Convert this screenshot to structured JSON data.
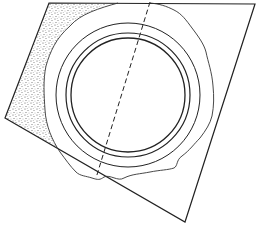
{
  "diagram": {
    "type": "line-art technical illustration",
    "stroke_color": "#222222",
    "stipple_color": "#555555",
    "background": "#ffffff",
    "plate": {
      "points": [
        [
          49,
          3
        ],
        [
          255,
          4
        ],
        [
          185,
          222
        ],
        [
          5,
          118
        ]
      ]
    },
    "rings": {
      "center": [
        128,
        95
      ],
      "radii": [
        57,
        62,
        72
      ]
    },
    "rough_edge": {
      "approx_radius": 86
    },
    "dashed_line": {
      "from": [
        150,
        2
      ],
      "to": [
        96,
        178
      ]
    }
  }
}
